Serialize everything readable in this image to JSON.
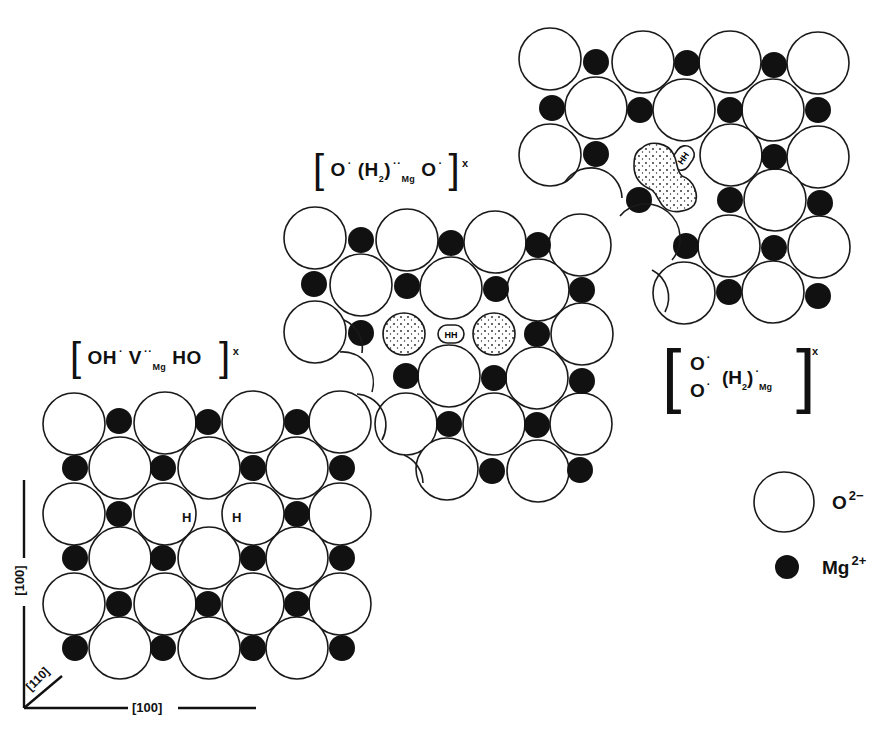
{
  "colors": {
    "oxygen_fill": "#ffffff",
    "outline": "#1a1a1a",
    "magnesium_fill": "#111111",
    "background": "#ffffff"
  },
  "labels": {
    "defect_left": {
      "open": "[",
      "main": "OH",
      "dot1": "·",
      "v": "V",
      "v_charge": "··",
      "v_site": "Mg",
      "ho": "HO",
      "close": "]",
      "charge": "x"
    },
    "defect_middle": {
      "open": "[",
      "o1": "O",
      "dot1": "·",
      "h2": "(H",
      "h2_sub": "2",
      "h2_close": ")",
      "h2_charge": "··",
      "h2_site": "Mg",
      "o2": "O",
      "dot2": "·",
      "close": "]",
      "charge": "x"
    },
    "defect_right": {
      "open": "[",
      "o_top": "O",
      "o_bottom": "O",
      "dot": "·",
      "h2": "(H",
      "h2_sub": "2",
      "h2_close": ")",
      "h2_charge": "·",
      "h2_site": "Mg",
      "close": "]",
      "charge": "x"
    },
    "h_left": "H",
    "h_right": "H",
    "hh_middle": "HH",
    "hh_right": "HH"
  },
  "axes": {
    "vertical": "[100]",
    "horizontal": "[100]",
    "diagonal": "[110]"
  },
  "legend": [
    {
      "symbol": "open-circle",
      "label": "O",
      "charge": "2−"
    },
    {
      "symbol": "filled-circle",
      "label": "Mg",
      "charge": "2+"
    }
  ],
  "lattices": {
    "left": {
      "o": [
        [
          74,
          424
        ],
        [
          165,
          423
        ],
        [
          253,
          422
        ],
        [
          340,
          422
        ],
        [
          120,
          468
        ],
        [
          209,
          468
        ],
        [
          297,
          468
        ],
        [
          74,
          514
        ],
        [
          165,
          514
        ],
        [
          253,
          514
        ],
        [
          340,
          514
        ],
        [
          120,
          558
        ],
        [
          209,
          558
        ],
        [
          297,
          558
        ],
        [
          74,
          604
        ],
        [
          165,
          604
        ],
        [
          253,
          604
        ],
        [
          340,
          604
        ],
        [
          120,
          648
        ],
        [
          209,
          648
        ],
        [
          297,
          648
        ]
      ],
      "mg": [
        [
          119,
          421
        ],
        [
          208,
          422
        ],
        [
          297,
          422
        ],
        [
          75,
          468
        ],
        [
          163,
          468
        ],
        [
          253,
          468
        ],
        [
          342,
          468
        ],
        [
          119,
          514
        ],
        [
          297,
          514
        ],
        [
          75,
          558
        ],
        [
          163,
          558
        ],
        [
          253,
          558
        ],
        [
          342,
          558
        ],
        [
          119,
          604
        ],
        [
          208,
          604
        ],
        [
          297,
          604
        ],
        [
          75,
          648
        ],
        [
          163,
          648
        ],
        [
          253,
          648
        ],
        [
          342,
          648
        ]
      ],
      "h_open_o": [
        [
          150,
          513
        ],
        [
          240,
          513
        ]
      ]
    },
    "middle": {
      "o": [
        [
          315,
          238
        ],
        [
          407,
          240
        ],
        [
          495,
          242
        ],
        [
          580,
          245
        ],
        [
          361,
          285
        ],
        [
          451,
          288
        ],
        [
          538,
          290
        ],
        [
          315,
          332
        ],
        [
          582,
          334
        ],
        [
          449,
          376
        ],
        [
          537,
          378
        ],
        [
          406,
          424
        ],
        [
          494,
          424
        ],
        [
          581,
          424
        ],
        [
          447,
          469
        ],
        [
          538,
          471
        ]
      ],
      "mg": [
        [
          361,
          240
        ],
        [
          451,
          243
        ],
        [
          538,
          245
        ],
        [
          314,
          284
        ],
        [
          407,
          286
        ],
        [
          496,
          289
        ],
        [
          582,
          290
        ],
        [
          361,
          333
        ],
        [
          537,
          334
        ],
        [
          406,
          376
        ],
        [
          494,
          378
        ],
        [
          582,
          381
        ],
        [
          449,
          424
        ],
        [
          537,
          425
        ],
        [
          492,
          471
        ],
        [
          580,
          470
        ]
      ],
      "stipple": [
        [
          404,
          334
        ],
        [
          494,
          334
        ]
      ],
      "hh": [
        451,
        334
      ]
    },
    "right": {
      "o": [
        [
          550,
          59
        ],
        [
          643,
          62
        ],
        [
          730,
          62
        ],
        [
          818,
          63
        ],
        [
          596,
          108
        ],
        [
          684,
          110
        ],
        [
          773,
          110
        ],
        [
          550,
          155
        ],
        [
          731,
          155
        ],
        [
          818,
          157
        ],
        [
          775,
          200
        ],
        [
          729,
          246
        ],
        [
          819,
          247
        ],
        [
          684,
          293
        ],
        [
          773,
          292
        ]
      ],
      "mg": [
        [
          596,
          62
        ],
        [
          687,
          63
        ],
        [
          774,
          65
        ],
        [
          552,
          108
        ],
        [
          640,
          110
        ],
        [
          730,
          110
        ],
        [
          818,
          110
        ],
        [
          596,
          154
        ],
        [
          774,
          157
        ],
        [
          639,
          200
        ],
        [
          730,
          200
        ],
        [
          820,
          203
        ],
        [
          686,
          246
        ],
        [
          774,
          248
        ],
        [
          729,
          292
        ],
        [
          818,
          296
        ]
      ],
      "hh": [
        683,
        158
      ]
    }
  }
}
